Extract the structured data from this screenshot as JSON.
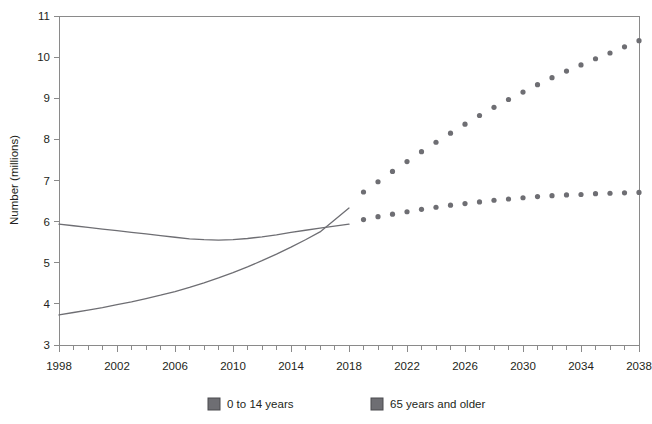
{
  "chart_data": {
    "type": "line",
    "title": "",
    "subtitle": "",
    "xlabel": "",
    "ylabel": "Number (millions)",
    "xlim": [
      1998,
      2038
    ],
    "ylim": [
      3,
      11
    ],
    "grid": false,
    "legend_position": "bottom",
    "x_tick_labels": [
      "1998",
      "2002",
      "2006",
      "2010",
      "2014",
      "2018",
      "2022",
      "2026",
      "2030",
      "2034",
      "2038"
    ],
    "x_tick_label_values": [
      1998,
      2002,
      2006,
      2010,
      2014,
      2018,
      2022,
      2026,
      2030,
      2034,
      2038
    ],
    "x_minor_tick_step": 1,
    "y_tick_labels": [
      "3",
      "4",
      "5",
      "6",
      "7",
      "8",
      "9",
      "10",
      "11"
    ],
    "y_tick_values": [
      3,
      4,
      5,
      6,
      7,
      8,
      9,
      10,
      11
    ],
    "annotations": [
      "Solid lines show estimates to 2018; dotted markers show projections from 2018 to 2038."
    ],
    "series": [
      {
        "name": "0 to 14 years",
        "style": "solid-then-dotted",
        "color": "#6e6e73",
        "x": [
          1998,
          1999,
          2000,
          2001,
          2002,
          2003,
          2004,
          2005,
          2006,
          2007,
          2008,
          2009,
          2010,
          2011,
          2012,
          2013,
          2014,
          2015,
          2016,
          2017,
          2018
        ],
        "values": [
          5.94,
          5.9,
          5.86,
          5.82,
          5.78,
          5.74,
          5.7,
          5.66,
          5.62,
          5.58,
          5.56,
          5.55,
          5.56,
          5.59,
          5.63,
          5.68,
          5.74,
          5.79,
          5.84,
          5.89,
          5.94
        ],
        "projection_x": [
          2018,
          2019,
          2020,
          2021,
          2022,
          2023,
          2024,
          2025,
          2026,
          2027,
          2028,
          2029,
          2030,
          2031,
          2032,
          2033,
          2034,
          2035,
          2036,
          2037,
          2038
        ],
        "projection_values": [
          5.97,
          6.05,
          6.12,
          6.18,
          6.24,
          6.3,
          6.35,
          6.4,
          6.44,
          6.48,
          6.52,
          6.55,
          6.58,
          6.61,
          6.63,
          6.65,
          6.66,
          6.68,
          6.69,
          6.7,
          6.71
        ]
      },
      {
        "name": "65 years and older",
        "style": "solid-then-dotted",
        "color": "#6e6e73",
        "x": [
          1998,
          1999,
          2000,
          2001,
          2002,
          2003,
          2004,
          2005,
          2006,
          2007,
          2008,
          2009,
          2010,
          2011,
          2012,
          2013,
          2014,
          2015,
          2016,
          2017,
          2018
        ],
        "values": [
          3.73,
          3.79,
          3.85,
          3.91,
          3.98,
          4.05,
          4.13,
          4.21,
          4.3,
          4.4,
          4.51,
          4.63,
          4.76,
          4.9,
          5.05,
          5.21,
          5.38,
          5.56,
          5.75,
          6.04,
          6.33
        ],
        "projection_x": [
          2018,
          2019,
          2020,
          2021,
          2022,
          2023,
          2024,
          2025,
          2026,
          2027,
          2028,
          2029,
          2030,
          2031,
          2032,
          2033,
          2034,
          2035,
          2036,
          2037,
          2038
        ],
        "projection_values": [
          6.55,
          6.72,
          6.97,
          7.22,
          7.46,
          7.7,
          7.93,
          8.15,
          8.37,
          8.58,
          8.78,
          8.97,
          9.15,
          9.33,
          9.5,
          9.66,
          9.81,
          9.96,
          10.1,
          10.25,
          10.4
        ]
      }
    ]
  },
  "legend": {
    "items": [
      {
        "label": "0 to 14 years",
        "color": "#6e6e73"
      },
      {
        "label": "65 years and older",
        "color": "#6e6e73"
      }
    ]
  },
  "axis": {
    "y_title": "Number (millions)"
  },
  "colors": {
    "series": "#6e6e73",
    "frame": "#8a8a8a",
    "text": "#231f20",
    "background": "#ffffff"
  }
}
